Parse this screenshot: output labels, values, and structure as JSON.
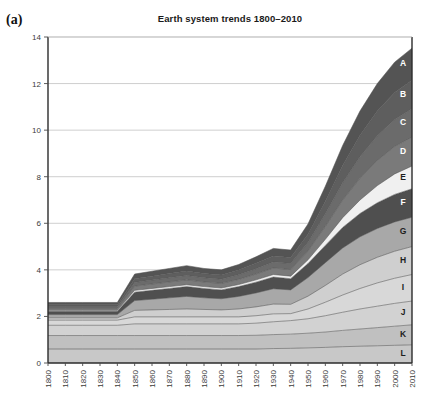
{
  "panel": {
    "letter": "(a)"
  },
  "chart_data": {
    "type": "area",
    "stacked": true,
    "title": "Earth system trends 1800–2010",
    "xlabel": "",
    "ylabel": "",
    "xlim": [
      1800,
      2010
    ],
    "ylim": [
      0,
      14
    ],
    "ytick_step": 2,
    "xtick_step": 10,
    "grid": true,
    "grid_axis": "y",
    "legend": "inline-right-edge",
    "x": [
      1800,
      1810,
      1820,
      1830,
      1840,
      1850,
      1860,
      1870,
      1880,
      1890,
      1900,
      1910,
      1920,
      1930,
      1940,
      1950,
      1960,
      1970,
      1980,
      1990,
      2000,
      2010
    ],
    "ytick_labels": [
      "0",
      "2",
      "4",
      "6",
      "8",
      "10",
      "12",
      "14"
    ],
    "xtick_labels": [
      "1800",
      "1810",
      "1820",
      "1830",
      "1840",
      "1850",
      "1860",
      "1870",
      "1880",
      "1890",
      "1900",
      "1910",
      "1920",
      "1930",
      "1940",
      "1950",
      "1960",
      "1970",
      "1980",
      "1990",
      "2000",
      "2010"
    ],
    "stack_order_top_to_bottom": [
      "A",
      "B",
      "C",
      "D",
      "E",
      "F",
      "G",
      "H",
      "I",
      "J",
      "K",
      "L"
    ],
    "series": [
      {
        "name": "L",
        "label": "L",
        "color": "#c8c8c8",
        "values": [
          0.6,
          0.6,
          0.6,
          0.6,
          0.6,
          0.6,
          0.6,
          0.6,
          0.6,
          0.6,
          0.6,
          0.6,
          0.6,
          0.62,
          0.63,
          0.65,
          0.67,
          0.7,
          0.72,
          0.74,
          0.76,
          0.78
        ]
      },
      {
        "name": "K",
        "label": "K",
        "color": "#c0c0c0",
        "values": [
          0.58,
          0.58,
          0.58,
          0.58,
          0.58,
          0.58,
          0.58,
          0.58,
          0.58,
          0.58,
          0.58,
          0.58,
          0.59,
          0.6,
          0.61,
          0.63,
          0.66,
          0.7,
          0.74,
          0.78,
          0.82,
          0.86
        ]
      },
      {
        "name": "J",
        "label": "J",
        "color": "#d2d2d2",
        "values": [
          0.44,
          0.44,
          0.44,
          0.44,
          0.44,
          0.5,
          0.5,
          0.5,
          0.5,
          0.5,
          0.5,
          0.5,
          0.52,
          0.55,
          0.58,
          0.62,
          0.7,
          0.78,
          0.86,
          0.92,
          0.98,
          1.02
        ]
      },
      {
        "name": "I",
        "label": "I",
        "color": "#d8d8d8",
        "values": [
          0.22,
          0.22,
          0.22,
          0.22,
          0.22,
          0.3,
          0.3,
          0.3,
          0.3,
          0.3,
          0.3,
          0.3,
          0.32,
          0.34,
          0.3,
          0.42,
          0.58,
          0.74,
          0.88,
          1.0,
          1.08,
          1.14
        ]
      },
      {
        "name": "H",
        "label": "H",
        "color": "#cfcfcf",
        "values": [
          0.1,
          0.1,
          0.1,
          0.1,
          0.1,
          0.28,
          0.3,
          0.32,
          0.34,
          0.32,
          0.3,
          0.34,
          0.38,
          0.42,
          0.4,
          0.55,
          0.72,
          0.9,
          1.02,
          1.1,
          1.16,
          1.2
        ]
      },
      {
        "name": "G",
        "label": "G",
        "color": "#a8a8a8",
        "values": [
          0.14,
          0.14,
          0.14,
          0.14,
          0.14,
          0.42,
          0.46,
          0.5,
          0.54,
          0.5,
          0.48,
          0.54,
          0.6,
          0.66,
          0.62,
          0.8,
          0.98,
          1.12,
          1.2,
          1.24,
          1.26,
          1.26
        ]
      },
      {
        "name": "F",
        "label": "F",
        "color": "#4f4f4f",
        "values": [
          0.14,
          0.14,
          0.14,
          0.14,
          0.14,
          0.36,
          0.38,
          0.4,
          0.42,
          0.4,
          0.38,
          0.42,
          0.46,
          0.5,
          0.48,
          0.6,
          0.74,
          0.88,
          1.0,
          1.1,
          1.18,
          1.22
        ]
      },
      {
        "name": "E",
        "label": "E",
        "color": "#f0f0f0",
        "values": [
          0.04,
          0.04,
          0.04,
          0.04,
          0.04,
          0.08,
          0.08,
          0.08,
          0.08,
          0.08,
          0.08,
          0.09,
          0.1,
          0.11,
          0.11,
          0.16,
          0.26,
          0.42,
          0.58,
          0.74,
          0.88,
          0.98
        ]
      },
      {
        "name": "D",
        "label": "D",
        "color": "#7a7a7a",
        "values": [
          0.08,
          0.08,
          0.08,
          0.08,
          0.08,
          0.18,
          0.19,
          0.2,
          0.21,
          0.2,
          0.2,
          0.22,
          0.25,
          0.28,
          0.28,
          0.38,
          0.56,
          0.76,
          0.94,
          1.08,
          1.18,
          1.24
        ]
      },
      {
        "name": "C",
        "label": "C",
        "color": "#6b6b6b",
        "values": [
          0.08,
          0.08,
          0.08,
          0.08,
          0.08,
          0.16,
          0.17,
          0.18,
          0.19,
          0.18,
          0.18,
          0.2,
          0.23,
          0.26,
          0.26,
          0.36,
          0.54,
          0.74,
          0.92,
          1.06,
          1.16,
          1.22
        ]
      },
      {
        "name": "B",
        "label": "B",
        "color": "#5e5e5e",
        "values": [
          0.08,
          0.08,
          0.08,
          0.08,
          0.08,
          0.16,
          0.17,
          0.18,
          0.19,
          0.18,
          0.18,
          0.2,
          0.23,
          0.26,
          0.26,
          0.36,
          0.54,
          0.74,
          0.92,
          1.06,
          1.16,
          1.22
        ]
      },
      {
        "name": "A",
        "label": "A",
        "color": "#545454",
        "values": [
          0.1,
          0.1,
          0.1,
          0.1,
          0.1,
          0.2,
          0.21,
          0.22,
          0.23,
          0.22,
          0.22,
          0.24,
          0.28,
          0.32,
          0.32,
          0.44,
          0.64,
          0.86,
          1.04,
          1.18,
          1.3,
          1.38
        ]
      }
    ],
    "totals": [
      2.4,
      2.4,
      2.4,
      2.4,
      2.4,
      3.42,
      3.52,
      3.6,
      3.7,
      3.58,
      3.5,
      3.83,
      4.16,
      4.52,
      4.45,
      5.97,
      7.59,
      9.34,
      10.82,
      11.92,
      12.0,
      11.9
    ],
    "colors": {
      "gridline": "#b9b9b9",
      "axis": "#2b2b2b",
      "tick_text": "#3b3b3b",
      "title": "#1a1a1a",
      "background": "#ffffff"
    }
  }
}
